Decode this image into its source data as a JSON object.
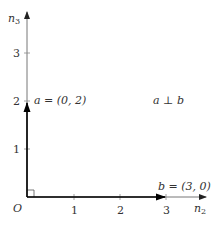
{
  "diagram": {
    "title": "",
    "axes": {
      "x_label": "n",
      "x_label_sub": "2",
      "y_label": "n",
      "y_label_sub": "3",
      "origin_label": "O",
      "x_ticks": [
        "1",
        "2",
        "3"
      ],
      "y_ticks": [
        "1",
        "2",
        "3"
      ]
    },
    "vectors": [
      {
        "name": "a",
        "label": "a = (0, 2)",
        "components": [
          0,
          2
        ]
      },
      {
        "name": "b",
        "label": "b = (3, 0)",
        "components": [
          3,
          0
        ]
      }
    ],
    "annotation": "a ⊥ b",
    "colors": {
      "axis": "#555555",
      "vector": "#111111",
      "text": "#333333"
    }
  }
}
